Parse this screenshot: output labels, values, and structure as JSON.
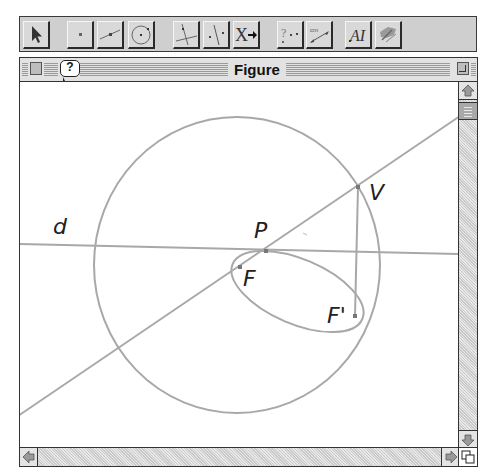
{
  "toolbar": {
    "groups": [
      {
        "buttons": [
          {
            "name": "pointer-tool",
            "icon": "arrow-pointer-icon"
          }
        ]
      },
      {
        "buttons": [
          {
            "name": "point-tool",
            "icon": "point-icon"
          },
          {
            "name": "line-tool",
            "icon": "line-icon"
          },
          {
            "name": "circle-tool",
            "icon": "circle-icon"
          }
        ]
      },
      {
        "buttons": [
          {
            "name": "perpendicular-tool",
            "icon": "perpendicular-icon"
          },
          {
            "name": "symmetry-tool",
            "icon": "symmetry-icon"
          },
          {
            "name": "transform-tool",
            "icon": "transform-x-arrow-icon",
            "text": "X"
          }
        ]
      },
      {
        "buttons": [
          {
            "name": "property-check-tool",
            "icon": "question-points-icon",
            "text": "?"
          },
          {
            "name": "measure-tool",
            "icon": "measure-cm-icon",
            "text": "cm"
          }
        ]
      },
      {
        "buttons": [
          {
            "name": "text-label-tool",
            "icon": "text-ai-icon",
            "text": "AI"
          },
          {
            "name": "appearance-tool",
            "icon": "paint-brush-icon"
          }
        ]
      }
    ]
  },
  "window": {
    "title": "Figure",
    "help_icon": "?",
    "close_box": "close-box",
    "zoom_box": "zoom-box"
  },
  "figure": {
    "stroke_color": "#a8a8a8",
    "label_color": "#222222",
    "labels": {
      "d": "d",
      "P": "P",
      "F": "F",
      "F_prime": "F'",
      "V": "V"
    },
    "points": {
      "P": [
        266,
        251
      ],
      "F": [
        240,
        267
      ],
      "F_prime": [
        355,
        316
      ],
      "V": [
        358,
        187
      ]
    }
  },
  "scrollbars": {
    "vertical": {
      "up": "up-arrow",
      "down": "down-arrow",
      "thumb_position": "top"
    },
    "horizontal": {
      "left": "left-arrow",
      "right": "right-arrow"
    }
  }
}
